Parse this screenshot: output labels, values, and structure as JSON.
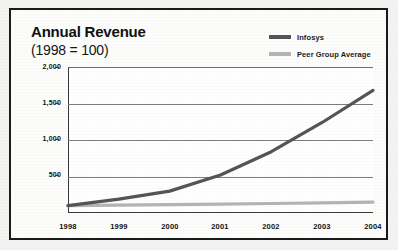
{
  "figure": {
    "title": "Annual Revenue",
    "subtitle": "(1998 = 100)",
    "border_color": "#1a1a1a",
    "background_color": "#fdfdfc"
  },
  "legend": {
    "position": "top-right",
    "entries": [
      {
        "label": "Infosys",
        "color": "#555555"
      },
      {
        "label": "Peer Group Average",
        "color": "#b4b4b4"
      }
    ]
  },
  "axes": {
    "y_ticks": [
      "2,000",
      "1,500",
      "1,000",
      "500"
    ],
    "x_ticks": [
      "1998",
      "1999",
      "2000",
      "2001",
      "2002",
      "2003",
      "2004"
    ]
  },
  "chart_data": {
    "type": "line",
    "title": "Annual Revenue",
    "subtitle": "(1998 = 100)",
    "xlabel": "",
    "ylabel": "",
    "x": [
      1998,
      1999,
      2000,
      2001,
      2002,
      2003,
      2004
    ],
    "categories": [
      "1998",
      "1999",
      "2000",
      "2001",
      "2002",
      "2003",
      "2004"
    ],
    "series": [
      {
        "name": "Infosys",
        "color": "#555555",
        "values": [
          100,
          190,
          300,
          520,
          840,
          1240,
          1680
        ]
      },
      {
        "name": "Peer Group Average",
        "color": "#b4b4b4",
        "values": [
          100,
          108,
          115,
          122,
          130,
          140,
          150
        ]
      }
    ],
    "ylim": [
      0,
      2000
    ],
    "yticks": [
      500,
      1000,
      1500,
      2000
    ],
    "ytick_labels": [
      "500",
      "1,000",
      "1,500",
      "2,000"
    ],
    "xlim": [
      1998,
      2004
    ],
    "grid": true,
    "grid_axis": "y",
    "legend_position": "top-right"
  }
}
